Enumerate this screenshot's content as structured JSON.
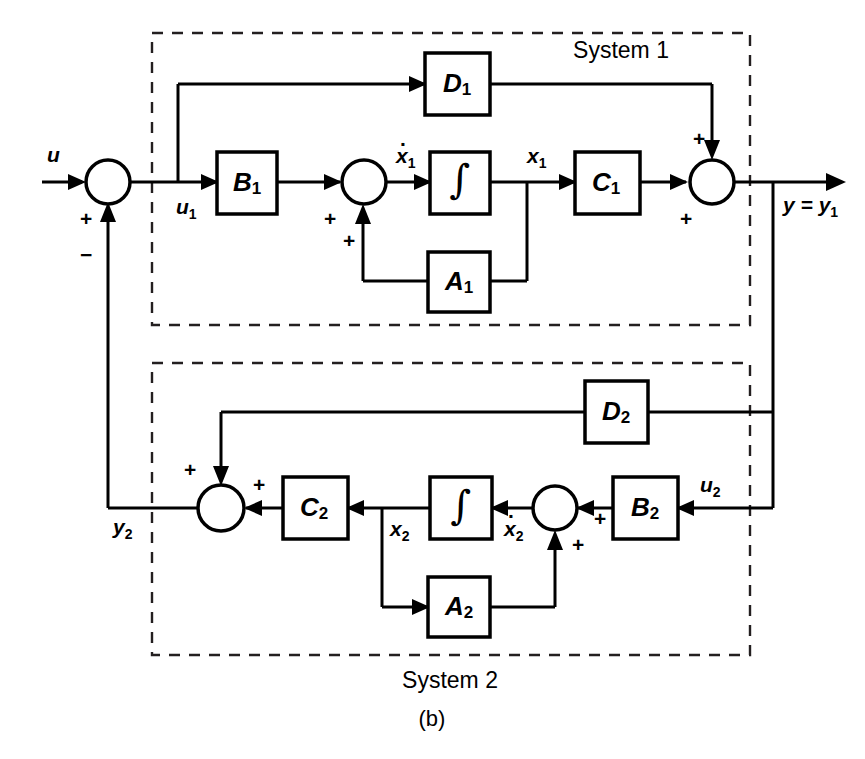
{
  "figure": {
    "panel_label": "(b)",
    "kind": "state-space block diagram, two interconnected systems in feedback",
    "line_color": "#000000",
    "background_color": "#ffffff",
    "dash_color": "#231f20"
  },
  "systems": [
    {
      "id": "system1",
      "label": "System 1",
      "label_position": "inside-top-right"
    },
    {
      "id": "system2",
      "label": "System 2",
      "label_position": "below-box-center"
    }
  ],
  "blocks": [
    {
      "id": "B1",
      "base": "B",
      "sub": "1",
      "system": "system1"
    },
    {
      "id": "D1",
      "base": "D",
      "sub": "1",
      "system": "system1"
    },
    {
      "id": "A1",
      "base": "A",
      "sub": "1",
      "system": "system1"
    },
    {
      "id": "C1",
      "base": "C",
      "sub": "1",
      "system": "system1"
    },
    {
      "id": "INT1",
      "base": "∫",
      "sub": "",
      "system": "system1"
    },
    {
      "id": "B2",
      "base": "B",
      "sub": "2",
      "system": "system2"
    },
    {
      "id": "D2",
      "base": "D",
      "sub": "2",
      "system": "system2"
    },
    {
      "id": "A2",
      "base": "A",
      "sub": "2",
      "system": "system2"
    },
    {
      "id": "C2",
      "base": "C",
      "sub": "2",
      "system": "system2"
    },
    {
      "id": "INT2",
      "base": "∫",
      "sub": "",
      "system": "system2"
    }
  ],
  "signals": {
    "u": {
      "base": "u",
      "sub": ""
    },
    "u1": {
      "base": "u",
      "sub": "1"
    },
    "xdot1": {
      "base": "x",
      "sub": "1",
      "dot": true
    },
    "x1": {
      "base": "x",
      "sub": "1"
    },
    "y_eq_y1": {
      "text_base": "y",
      "text_eq": " = ",
      "text_base2": "y",
      "sub2": "1"
    },
    "y2": {
      "base": "y",
      "sub": "2"
    },
    "u2": {
      "base": "u",
      "sub": "2"
    },
    "xdot2": {
      "base": "x",
      "sub": "2",
      "dot": true
    },
    "x2": {
      "base": "x",
      "sub": "2"
    }
  },
  "sum_junctions": [
    {
      "id": "sum-input",
      "system": "none",
      "signs": [
        {
          "label": "+",
          "port": "left"
        },
        {
          "label": "−",
          "port": "bottom"
        }
      ]
    },
    {
      "id": "sum-state1",
      "system": "system1",
      "signs": [
        {
          "label": "+",
          "port": "left"
        },
        {
          "label": "+",
          "port": "bottom"
        }
      ]
    },
    {
      "id": "sum-output1",
      "system": "system1",
      "signs": [
        {
          "label": "+",
          "port": "top"
        },
        {
          "label": "+",
          "port": "left"
        }
      ]
    },
    {
      "id": "sum-output2",
      "system": "system2",
      "signs": [
        {
          "label": "+",
          "port": "top"
        },
        {
          "label": "+",
          "port": "right"
        }
      ]
    },
    {
      "id": "sum-state2",
      "system": "system2",
      "signs": [
        {
          "label": "+",
          "port": "right"
        },
        {
          "label": "+",
          "port": "bottom"
        }
      ]
    }
  ]
}
